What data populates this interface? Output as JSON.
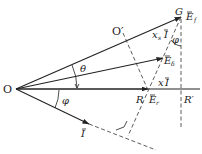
{
  "figure": {
    "type": "phasor diagram",
    "points": {
      "origin": "O",
      "o_prime": "O′",
      "g": "G",
      "r": "R",
      "r_prime": "R′"
    },
    "phasors": {
      "ef": {
        "symbol": "E",
        "subscript": "f"
      },
      "edelta": {
        "symbol": "E",
        "subscript": "δ"
      },
      "er": {
        "symbol": "E",
        "subscript": "r"
      },
      "current": {
        "symbol": "I"
      },
      "xs_i": {
        "prefix": "x",
        "prefix_sub": "s",
        "symbol": "I"
      },
      "x_i": {
        "prefix": "x",
        "symbol": "I"
      }
    },
    "angles": {
      "theta": "θ",
      "phi_lower": "φ",
      "phi_upper": "φ"
    }
  }
}
